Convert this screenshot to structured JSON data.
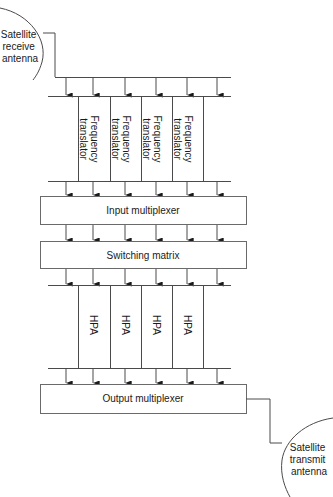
{
  "diagram": {
    "receive_antenna": {
      "label_lines": [
        "Satellite",
        "receive",
        "antenna"
      ]
    },
    "transmit_antenna": {
      "label_lines": [
        "Satellite",
        "transmit",
        "antenna"
      ]
    },
    "channel_count": 6,
    "frequency_translators": [
      {
        "label_lines": [
          "Frequency",
          "translator"
        ]
      },
      {
        "label_lines": [
          "Frequency",
          "translator"
        ]
      },
      {
        "label_lines": [
          "Frequency",
          "translator"
        ]
      },
      {
        "label_lines": [
          "Frequency",
          "translator"
        ]
      }
    ],
    "input_multiplexer": {
      "label": "Input multiplexer"
    },
    "switching_matrix": {
      "label": "Switching matrix"
    },
    "hpas": [
      {
        "label": "HPA"
      },
      {
        "label": "HPA"
      },
      {
        "label": "HPA"
      },
      {
        "label": "HPA"
      }
    ],
    "output_multiplexer": {
      "label": "Output multiplexer"
    },
    "colors": {
      "line": "#4a4a4a",
      "box_border": "#6a6a6a",
      "text": "#1a1a1a",
      "background": "#ffffff"
    }
  }
}
